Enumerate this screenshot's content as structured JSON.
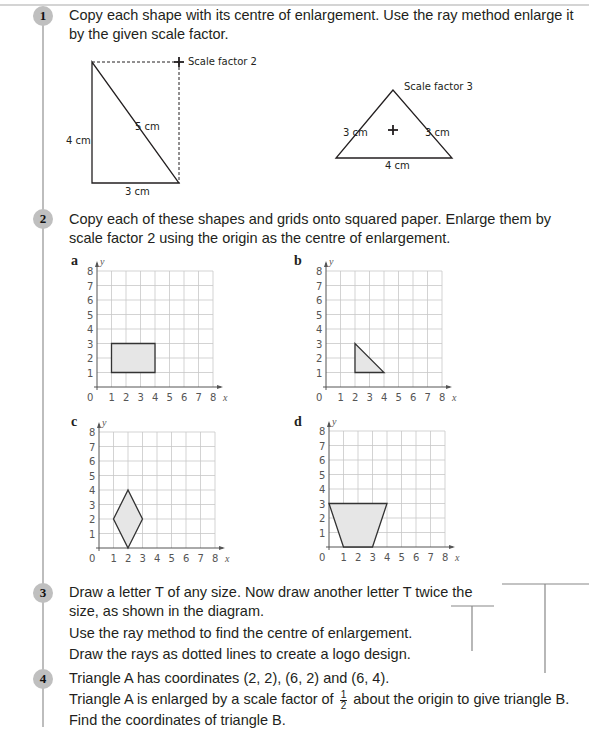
{
  "questions": [
    {
      "number": "1",
      "text": "Copy each shape with its centre of enlargement. Use the ray method enlarge it by the given scale factor.",
      "diagrams": [
        {
          "shape": "right-angled triangle",
          "labels": {
            "left": "4 cm",
            "hypotenuse": "5 cm",
            "bottom": "3 cm"
          },
          "scale_label": "Scale factor 2"
        },
        {
          "shape": "isosceles triangle",
          "labels": {
            "left": "3 cm",
            "right": "3 cm",
            "bottom": "4 cm"
          },
          "scale_label": "Scale factor 3"
        }
      ]
    },
    {
      "number": "2",
      "text": "Copy each of these shapes and grids onto squared paper. Enlarge them by scale factor 2 using the origin as the centre of enlargement.",
      "axis": {
        "x_label": "x",
        "y_label": "y",
        "origin_label": "0",
        "x_ticks": [
          "1",
          "2",
          "3",
          "4",
          "5",
          "6",
          "7",
          "8"
        ],
        "y_ticks": [
          "1",
          "2",
          "3",
          "4",
          "5",
          "6",
          "7",
          "8"
        ]
      },
      "parts": [
        {
          "label": "a",
          "shape": "rectangle",
          "points": [
            [
              1,
              1
            ],
            [
              4,
              1
            ],
            [
              4,
              3
            ],
            [
              1,
              3
            ]
          ]
        },
        {
          "label": "b",
          "shape": "triangle",
          "points": [
            [
              2,
              1
            ],
            [
              4,
              1
            ],
            [
              2,
              3
            ]
          ]
        },
        {
          "label": "c",
          "shape": "rhombus",
          "points": [
            [
              2,
              0
            ],
            [
              3,
              2
            ],
            [
              2,
              4
            ],
            [
              1,
              2
            ]
          ]
        },
        {
          "label": "d",
          "shape": "trapezium",
          "points": [
            [
              1,
              0
            ],
            [
              3,
              0
            ],
            [
              4,
              3
            ],
            [
              0,
              3
            ]
          ]
        }
      ]
    },
    {
      "number": "3",
      "lines": [
        "Draw a letter T of any size. Now draw another letter T twice the",
        "size, as shown in the diagram.",
        "Use the ray method to find the centre of enlargement.",
        "Draw the rays as dotted lines to create a logo design."
      ]
    },
    {
      "number": "4",
      "line1": "Triangle A has coordinates (2, 2), (6, 2) and (6, 4).",
      "line2_before": "Triangle A is enlarged by a scale factor of",
      "fraction_num": "1",
      "fraction_den": "2",
      "line2_after": "about the origin to give triangle B.",
      "line3": "Find the coordinates of triangle B."
    }
  ],
  "colors": {
    "badge": "#bfbfbf",
    "shape_fill": "#e6e6e6",
    "grid": "#c8c8c8",
    "bar": "#bdbdbd"
  }
}
